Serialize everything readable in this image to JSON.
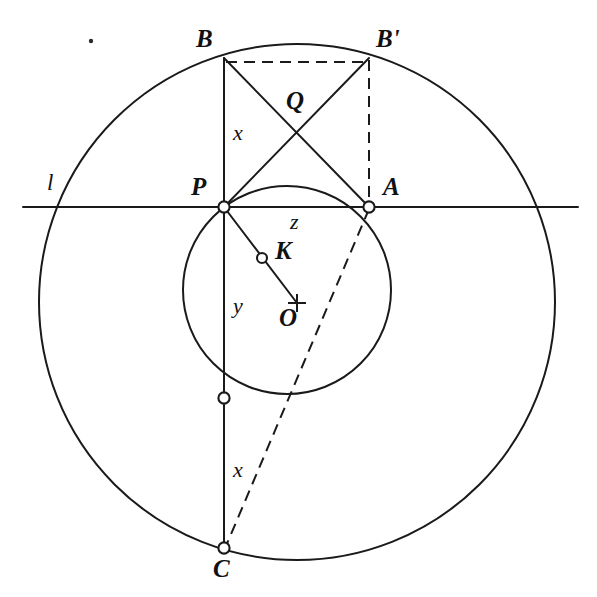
{
  "figure": {
    "background_color": "#ffffff",
    "ink_color": "#1a1a1a",
    "width": 597,
    "height": 597,
    "points": {
      "B": {
        "label": "B",
        "x": 224,
        "y": 58,
        "label_x": 196,
        "label_y": 26,
        "marked": false
      },
      "Bp": {
        "label": "B'",
        "x": 369,
        "y": 58,
        "label_x": 376,
        "label_y": 26,
        "marked": false
      },
      "Q": {
        "label": "Q",
        "x": 297,
        "y": 133,
        "label_x": 286,
        "label_y": 88,
        "marked": false
      },
      "P": {
        "label": "P",
        "x": 224,
        "y": 207,
        "label_x": 191,
        "label_y": 174,
        "marked": true
      },
      "A": {
        "label": "A",
        "x": 369,
        "y": 207,
        "label_x": 383,
        "label_y": 174,
        "marked": true
      },
      "K": {
        "label": "K",
        "x": 262,
        "y": 258,
        "label_x": 275,
        "label_y": 238,
        "marked": true
      },
      "O": {
        "label": "O",
        "x": 297,
        "y": 303,
        "label_x": 279,
        "label_y": 305,
        "marked": false
      },
      "D": {
        "label": "",
        "x": 224,
        "y": 398,
        "label_x": 0,
        "label_y": 0,
        "marked": true
      },
      "C": {
        "label": "C",
        "x": 224,
        "y": 548,
        "label_x": 213,
        "label_y": 556,
        "marked": true
      }
    },
    "segment_labels": {
      "x_upper": {
        "text": "x",
        "x": 233,
        "y": 122
      },
      "x_lower": {
        "text": "x",
        "x": 233,
        "y": 459
      },
      "y": {
        "text": "y",
        "x": 233,
        "y": 295
      },
      "z": {
        "text": "z",
        "x": 290,
        "y": 211
      },
      "l": {
        "text": "l",
        "x": 47,
        "y": 171
      }
    },
    "circles": [
      {
        "name": "outer-circle",
        "cx": 297,
        "cy": 302,
        "r": 258,
        "stroke_width": 2.0
      },
      {
        "name": "inner-circle",
        "cx": 287,
        "cy": 290,
        "r": 104,
        "stroke_width": 2.0
      }
    ],
    "line_l": {
      "name": "line-l",
      "x1": 23,
      "y1": 207,
      "x2": 578,
      "y2": 207,
      "stroke_width": 2.0
    },
    "solid_segments": [
      {
        "name": "segment-B-C",
        "x1": 224,
        "y1": 58,
        "x2": 224,
        "y2": 548
      },
      {
        "name": "segment-B-A",
        "x1": 224,
        "y1": 58,
        "x2": 369,
        "y2": 207
      },
      {
        "name": "segment-Bp-P",
        "x1": 369,
        "y1": 58,
        "x2": 224,
        "y2": 207
      },
      {
        "name": "segment-P-O",
        "x1": 224,
        "y1": 207,
        "x2": 297,
        "y2": 303
      }
    ],
    "dashed_segments": [
      {
        "name": "segment-B-Bp",
        "x1": 226,
        "y1": 62,
        "x2": 369,
        "y2": 62
      },
      {
        "name": "segment-Bp-A",
        "x1": 369,
        "y1": 60,
        "x2": 369,
        "y2": 205
      },
      {
        "name": "segment-A-C",
        "x1": 369,
        "y1": 209,
        "x2": 226,
        "y2": 546
      }
    ],
    "speck": {
      "name": "ink-speck",
      "x": 91,
      "y": 41,
      "r": 2.2
    }
  }
}
